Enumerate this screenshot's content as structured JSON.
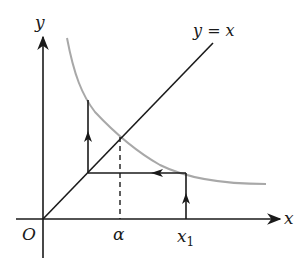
{
  "diagram": {
    "labels": {
      "y_axis": "y",
      "x_axis": "x",
      "origin": "O",
      "line": "y = x",
      "alpha": "α",
      "x1_base": "x",
      "x1_sub": "1"
    },
    "colors": {
      "axes": "#1a1a1a",
      "line": "#1a1a1a",
      "curve": "#a8a8a8",
      "cobweb": "#1a1a1a",
      "background": "#ffffff"
    }
  }
}
